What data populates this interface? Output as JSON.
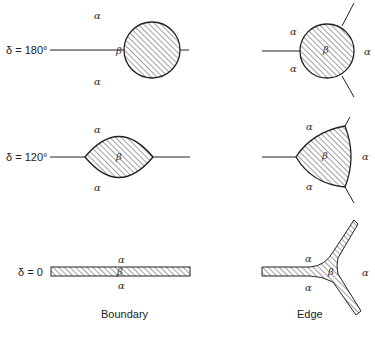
{
  "diagram": {
    "rows": [
      {
        "delta_label": "δ = 180°",
        "boundary": {
          "alpha_top": "α",
          "alpha_bottom": "α",
          "beta": "β"
        },
        "edge": {
          "alpha_upper_left": "α",
          "alpha_lower_left": "α",
          "alpha_right": "α",
          "beta": "β"
        }
      },
      {
        "delta_label": "δ = 120°",
        "boundary": {
          "alpha_top": "α",
          "alpha_bottom": "α",
          "beta": "β"
        },
        "edge": {
          "alpha_upper_left": "α",
          "alpha_lower_left": "α",
          "alpha_right": "α",
          "beta": "β"
        }
      },
      {
        "delta_label": "δ = 0",
        "boundary": {
          "alpha_top": "α",
          "alpha_bottom": "α",
          "beta": "β"
        },
        "edge": {
          "alpha_upper_left": "α",
          "alpha_lower_left": "α",
          "alpha_right": "α",
          "beta": "β"
        }
      }
    ],
    "captions": {
      "boundary": "Boundary",
      "edge": "Edge"
    },
    "colors": {
      "stroke": "#222222",
      "hatch": "#444444",
      "background": "#ffffff"
    }
  }
}
